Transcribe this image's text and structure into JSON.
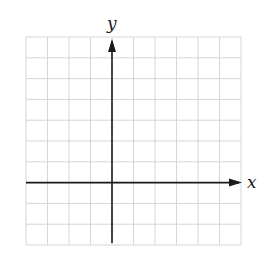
{
  "diagram": {
    "type": "coordinate-grid",
    "x_axis_label": "x",
    "y_axis_label": "y",
    "grid": {
      "columns": 10,
      "rows": 10,
      "left": 26,
      "top": 37,
      "width": 215,
      "height": 208,
      "y_axis_column": 4,
      "x_axis_row": 7
    },
    "colors": {
      "grid_line": "#d6d6d6",
      "axis": "#1a1a1a",
      "background": "#ffffff"
    }
  },
  "chart_data": {
    "type": "scatter",
    "title": "",
    "xlabel": "x",
    "ylabel": "y",
    "x": [],
    "y": [],
    "grid": true,
    "xlim": [
      -4,
      6
    ],
    "ylim": [
      -3,
      7
    ]
  }
}
